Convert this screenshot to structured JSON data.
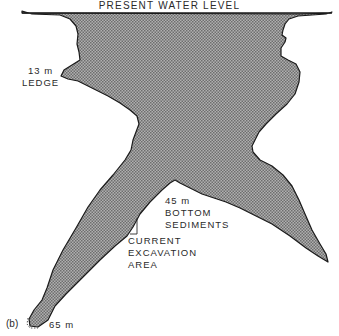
{
  "figure": {
    "panel_label": "(b)",
    "water_level_label": "PRESENT WATER LEVEL",
    "labels": {
      "ledge": {
        "depth": "13 m",
        "name": "LEDGE"
      },
      "bottom_sediments": {
        "depth": "45 m",
        "name_line1": "BOTTOM",
        "name_line2": "SEDIMENTS"
      },
      "excavation": {
        "line1": "CURRENT",
        "line2": "EXCAVATION",
        "line3": "AREA"
      },
      "max_depth": "65 m"
    },
    "colors": {
      "fill": "#9a9a9a",
      "fill_dot": "#6a6a6a",
      "outline": "#1a1a1a",
      "text": "#2a2a2a",
      "background": "#ffffff"
    }
  }
}
